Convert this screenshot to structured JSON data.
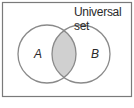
{
  "diagram": {
    "type": "venn",
    "title": "Universal set",
    "sets": [
      {
        "label": "A"
      },
      {
        "label": "B"
      }
    ],
    "shaded_region": "A ∩ B",
    "colors": {
      "stroke": "#8a8a8a",
      "shade": "#d0d0d0",
      "frame": "#7a7a7a"
    }
  }
}
